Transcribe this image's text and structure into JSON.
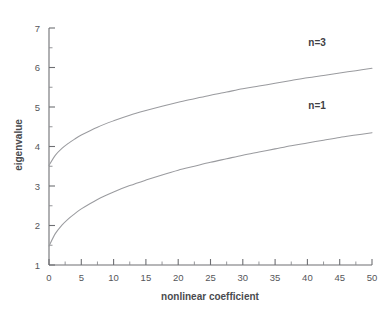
{
  "chart_data": {
    "type": "line",
    "title": "",
    "xlabel": "nonlinear coefficient",
    "ylabel": "eigenvalue",
    "xlim": [
      0,
      50
    ],
    "ylim": [
      1,
      7
    ],
    "xticks": [
      0,
      5,
      10,
      15,
      20,
      25,
      30,
      35,
      40,
      45,
      50
    ],
    "xtick_labels": [
      "0",
      "5",
      "10",
      "15",
      "20",
      "25",
      "30",
      "35",
      "40",
      "45",
      "50"
    ],
    "yticks": [
      1,
      2,
      3,
      4,
      5,
      6,
      7
    ],
    "ytick_labels": [
      "1",
      "2",
      "3",
      "4",
      "5",
      "6",
      "7"
    ],
    "x_minor_step": 2.5,
    "y_minor_step": 0.5,
    "grid": false,
    "legend_position": "inline-right",
    "x": [
      0,
      1,
      2,
      3,
      4,
      5,
      7.5,
      10,
      12.5,
      15,
      17.5,
      20,
      22.5,
      25,
      27.5,
      30,
      32.5,
      35,
      37.5,
      40,
      42.5,
      45,
      47.5,
      50
    ],
    "series": [
      {
        "name": "n=3",
        "label": "n=3",
        "color": "#9a9b9f",
        "values": [
          3.52,
          3.78,
          3.95,
          4.08,
          4.19,
          4.29,
          4.49,
          4.65,
          4.79,
          4.91,
          5.02,
          5.12,
          5.21,
          5.3,
          5.38,
          5.46,
          5.53,
          5.6,
          5.67,
          5.74,
          5.8,
          5.86,
          5.92,
          5.98
        ]
      },
      {
        "name": "n=1",
        "label": "n=1",
        "color": "#9a9b9f",
        "values": [
          1.48,
          1.8,
          2.01,
          2.17,
          2.3,
          2.42,
          2.66,
          2.85,
          3.01,
          3.15,
          3.28,
          3.4,
          3.5,
          3.6,
          3.69,
          3.78,
          3.86,
          3.94,
          4.02,
          4.09,
          4.16,
          4.23,
          4.29,
          4.35
        ]
      }
    ],
    "annotations": [
      {
        "text": "n=3",
        "x": 41.5,
        "y": 6.55
      },
      {
        "text": "n=1",
        "x": 41.5,
        "y": 4.95
      }
    ]
  }
}
